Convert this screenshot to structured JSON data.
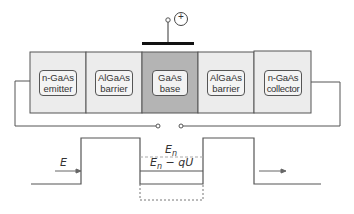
{
  "device": {
    "gate": {
      "terminal_symbol": "+"
    },
    "layers": [
      {
        "id": "emitter",
        "line1": "n-GaAs",
        "line2": "emitter",
        "fill": "#ececec"
      },
      {
        "id": "barrier-left",
        "line1": "AlGaAs",
        "line2": "barrier",
        "fill": "#ececec"
      },
      {
        "id": "base",
        "line1": "GaAs",
        "line2": "base",
        "fill": "#b4b4b4"
      },
      {
        "id": "barrier-right",
        "line1": "AlGaAs",
        "line2": "barrier",
        "fill": "#ececec"
      },
      {
        "id": "collector",
        "line1": "n-GaAs",
        "line2": "collector",
        "fill": "#ececec"
      }
    ]
  },
  "band_diagram": {
    "incident_energy_label": "E",
    "level_En_label": "E",
    "level_En_sub": "n",
    "level_shifted_label_main": "E",
    "level_shifted_sub": "n",
    "level_shifted_suffix": " − qU"
  },
  "colors": {
    "line": "#555555",
    "dashed": "#aaaaaa",
    "gate_bar": "#111111"
  }
}
